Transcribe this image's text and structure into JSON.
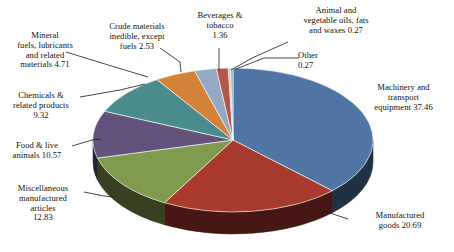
{
  "chart_title": "",
  "chart_data": {
    "type": "pie",
    "title": "",
    "subtitle": "",
    "xlabel": "",
    "ylabel": "",
    "units": "percent",
    "legend_position": "none",
    "grid": false,
    "labels_show_value": true,
    "start_angle_deg": -90,
    "direction": "clockwise",
    "three_d": true,
    "categories": [
      "Machinery and transport equipment",
      "Manufactured goods",
      "Miscellaneous manufactured articles",
      "Food & live animals",
      "Chemicals & related products",
      "Mineral fuels, lubricants and related materials",
      "Crude materials inedible, except fuels",
      "Beverages & tobacco",
      "Animal and vegetable oils, fats and waxes",
      "Other"
    ],
    "values": [
      37.46,
      20.69,
      12.83,
      10.57,
      9.32,
      4.71,
      2.53,
      1.36,
      0.27,
      0.27
    ],
    "colors": [
      "#4F75A4",
      "#A83A2E",
      "#7E9B4E",
      "#63527B",
      "#4A8C8E",
      "#D4823A",
      "#95A9C4",
      "#B2574A",
      "#E0C48C",
      "#8EA8CE"
    ],
    "slices": [
      {
        "label": "Machinery and transport equipment 37.46",
        "name": "Machinery and transport equipment",
        "value": 37.46,
        "color": "#4F75A4"
      },
      {
        "label": "Manufactured goods 20.69",
        "name": "Manufactured goods",
        "value": 20.69,
        "color": "#A83A2E"
      },
      {
        "label": "Miscellaneous manufactured articles 12.83",
        "name": "Miscellaneous manufactured articles",
        "value": 12.83,
        "color": "#7E9B4E"
      },
      {
        "label": "Food & live animals 10.57",
        "name": "Food & live animals",
        "value": 10.57,
        "color": "#63527B"
      },
      {
        "label": "Chemicals & related products 9.32",
        "name": "Chemicals & related products",
        "value": 9.32,
        "color": "#4A8C8E"
      },
      {
        "label": "Mineral fuels, lubricants and related materials 4.71",
        "name": "Mineral fuels, lubricants and related materials",
        "value": 4.71,
        "color": "#D4823A"
      },
      {
        "label": "Crude materials inedible, except fuels 2.53",
        "name": "Crude materials inedible, except fuels",
        "value": 2.53,
        "color": "#95A9C4"
      },
      {
        "label": "Beverages & tobacco 1.36",
        "name": "Beverages & tobacco",
        "value": 1.36,
        "color": "#B2574A"
      },
      {
        "label": "Animal and vegetable oils, fats and waxes 0.27",
        "name": "Animal and vegetable oils, fats and waxes",
        "value": 0.27,
        "color": "#E0C48C"
      },
      {
        "label": "Other 0.27",
        "name": "Other",
        "value": 0.27,
        "color": "#8EA8CE"
      }
    ]
  },
  "labels": {
    "mineral_fuels": "Mineral\nfuels, lubricants\nand related\nmaterials 4.71",
    "crude_materials": "Crude materials\ninedible, except\nfuels 2.53",
    "beverages": "Beverages &\ntobacco\n1.36",
    "animal_oils": "Animal and\nvegetable oils, fats\nand waxes 0.27",
    "other": "Other\n0.27",
    "machinery": "Machinery and\ntransport\nequipment 37.46",
    "manufactured_goods": "Manufactured\ngoods 20.69",
    "misc_manufactured": "Miscellaneous\nmanufactured\narticles\n12.83",
    "food_live_animals": "Food & live\nanimals 10.57",
    "chemicals": "Chemicals &\nrelated products\n9.32"
  }
}
